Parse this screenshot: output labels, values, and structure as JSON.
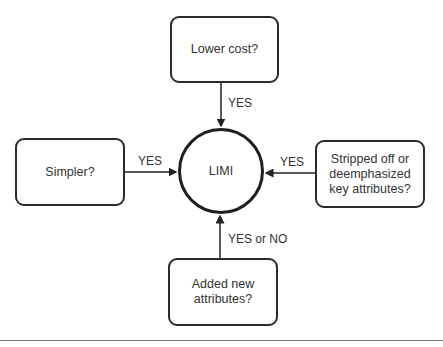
{
  "center": {
    "label": "LIMI"
  },
  "nodes": {
    "top": {
      "label": "Lower cost?",
      "edge_label": "YES"
    },
    "left": {
      "label": "Simpler?",
      "edge_label": "YES"
    },
    "right": {
      "label": "Stripped off or deemphasized key attributes?",
      "edge_label": "YES"
    },
    "bottom": {
      "label": "Added new attributes?",
      "edge_label": "YES or NO"
    }
  }
}
